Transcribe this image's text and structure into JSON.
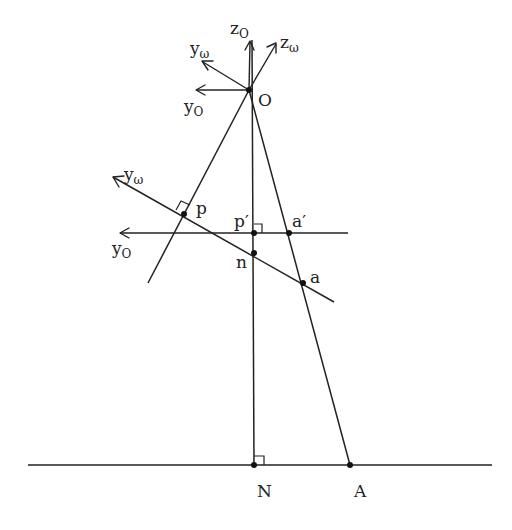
{
  "diagram": {
    "type": "geometry",
    "labels": {
      "z_o": {
        "base": "z",
        "sub": "O"
      },
      "z_w": {
        "base": "z",
        "sub": "ω"
      },
      "y_w_top": {
        "base": "y",
        "sub": "ω"
      },
      "y_o_top": {
        "base": "y",
        "sub": "O"
      },
      "O": "O",
      "y_w_mid": {
        "base": "y",
        "sub": "ω"
      },
      "y_o_mid": {
        "base": "y",
        "sub": "O"
      },
      "p": "p",
      "p_prime": "p′",
      "a_prime": "a′",
      "n": "n",
      "a": "a",
      "N": "N",
      "A": "A"
    },
    "points": {
      "O": [
        249,
        90
      ],
      "p": [
        184,
        214
      ],
      "p_prime": [
        254,
        233
      ],
      "a_prime": [
        289,
        233
      ],
      "n": [
        254,
        253
      ],
      "a": [
        303,
        283
      ],
      "N": [
        254,
        465
      ],
      "A": [
        350,
        465
      ]
    },
    "colors": {
      "line": "#222222",
      "background": "#ffffff"
    }
  }
}
